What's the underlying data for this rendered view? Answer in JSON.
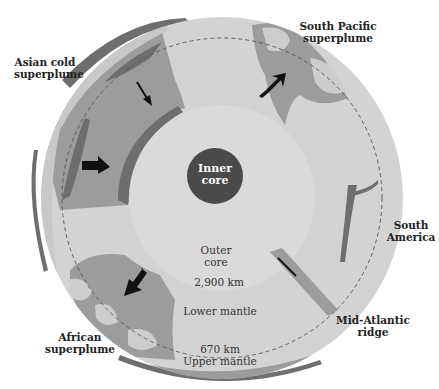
{
  "colors": {
    "background": "#ffffff",
    "lower_mantle": "#d3d3d3",
    "plume_medium": "#9c9c9c",
    "plume_dark": "#6e6e6e",
    "outer_core": "#d9d9d9",
    "inner_core": "#4a4a4a",
    "arrow": "#111111",
    "dashed_line": "#555555"
  },
  "labels": {
    "asian_cold_superplume": {
      "line1": "Asian cold",
      "line2": "superplume"
    },
    "south_pacific_superplume": {
      "line1": "South Pacific",
      "line2": "superplume"
    },
    "south_america": {
      "line1": "South",
      "line2": "America"
    },
    "mid_atlantic_ridge": {
      "line1": "Mid-Atlantic",
      "line2": "ridge"
    },
    "african_superplume": {
      "line1": "African",
      "line2": "superplume"
    },
    "inner_core": {
      "line1": "Inner",
      "line2": "core"
    },
    "outer_core": {
      "line1": "Outer",
      "line2": "core"
    },
    "depth_core_mantle": "2,900 km",
    "lower_mantle": "Lower mantle",
    "depth_670": "670 km",
    "upper_mantle": "Upper mantle"
  },
  "arrows": [
    {
      "name": "asian-downwelling-arrow-small",
      "direction": "down-right"
    },
    {
      "name": "asian-downwelling-arrow-large",
      "direction": "right"
    },
    {
      "name": "south-pacific-upwelling-arrow",
      "direction": "up-right"
    },
    {
      "name": "african-upwelling-arrow",
      "direction": "down-left"
    },
    {
      "name": "mid-atlantic-ridge-arrow",
      "direction": "down-right"
    }
  ]
}
